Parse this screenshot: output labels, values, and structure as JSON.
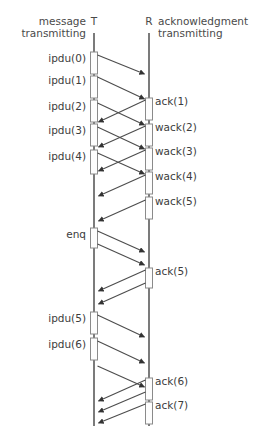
{
  "diagram": {
    "kind": "sequence-diagram",
    "headers": {
      "left_line1": "message",
      "left_line2": "transmitting",
      "right_line1": "acknowledgment",
      "right_line2": "transmitting"
    },
    "actors": [
      {
        "id": "T",
        "label": "T",
        "x": 94
      },
      {
        "id": "R",
        "label": "R",
        "x": 149
      }
    ],
    "lifeline": {
      "top": 33,
      "bottom": 426
    },
    "colors": {
      "line": "#4d4d4d",
      "lifeline": "#5a5a5a",
      "text": "#3c3c3c",
      "header_text": "#4a4a4a",
      "activation_fill": "#fdfdfd",
      "activation_stroke": "#8a8a8a",
      "background": "#ffffff"
    },
    "left_labels": [
      {
        "text": "ipdu(0)",
        "y": 62
      },
      {
        "text": "ipdu(1)",
        "y": 84
      },
      {
        "text": "ipdu(2)",
        "y": 110
      },
      {
        "text": "ipdu(3)",
        "y": 134
      },
      {
        "text": "ipdu(4)",
        "y": 160
      },
      {
        "text": "enq",
        "y": 238
      },
      {
        "text": "ipdu(5)",
        "y": 322
      },
      {
        "text": "ipdu(6)",
        "y": 348
      }
    ],
    "right_labels": [
      {
        "text": "ack(1)",
        "y": 105
      },
      {
        "text": "wack(2)",
        "y": 131
      },
      {
        "text": "wack(3)",
        "y": 155
      },
      {
        "text": "wack(4)",
        "y": 180
      },
      {
        "text": "wack(5)",
        "y": 205
      },
      {
        "text": "ack(5)",
        "y": 275
      },
      {
        "text": "ack(6)",
        "y": 385
      },
      {
        "text": "ack(7)",
        "y": 409
      }
    ],
    "messages": [
      {
        "from": "T",
        "to": "R",
        "label": "ipdu(0)",
        "y1": 55,
        "y2": 74
      },
      {
        "from": "T",
        "to": "R",
        "label": "ipdu(1)",
        "y1": 77,
        "y2": 99
      },
      {
        "from": "T",
        "to": "R",
        "label": "ipdu(2)",
        "y1": 103,
        "y2": 125
      },
      {
        "from": "T",
        "to": "R",
        "label": "ipdu(3)",
        "y1": 127,
        "y2": 149
      },
      {
        "from": "T",
        "to": "R",
        "label": "ipdu(4)",
        "y1": 153,
        "y2": 174
      },
      {
        "from": "R",
        "to": "T",
        "label": "ack(1)",
        "y1": 100,
        "y2": 122
      },
      {
        "from": "R",
        "to": "T",
        "label": "wack(2)",
        "y1": 126,
        "y2": 147
      },
      {
        "from": "R",
        "to": "T",
        "label": "wack(3)",
        "y1": 150,
        "y2": 171
      },
      {
        "from": "R",
        "to": "T",
        "label": "wack(4)",
        "y1": 175,
        "y2": 196
      },
      {
        "from": "R",
        "to": "T",
        "label": "wack(5)",
        "y1": 200,
        "y2": 221
      },
      {
        "from": "T",
        "to": "R",
        "label": "enq",
        "y1": 231,
        "y2": 252
      },
      {
        "from": "T",
        "to": "R",
        "label": "enq",
        "y1": 244,
        "y2": 265
      },
      {
        "from": "R",
        "to": "T",
        "label": "ack(5)",
        "y1": 270,
        "y2": 291
      },
      {
        "from": "R",
        "to": "T",
        "label": "ack(5)",
        "y1": 283,
        "y2": 304
      },
      {
        "from": "T",
        "to": "R",
        "label": "ipdu(5)",
        "y1": 315,
        "y2": 337
      },
      {
        "from": "T",
        "to": "R",
        "label": "ipdu(6)",
        "y1": 341,
        "y2": 363
      },
      {
        "from": "T",
        "to": "R",
        "label": "ipdu(7)",
        "y1": 366,
        "y2": 387
      },
      {
        "from": "R",
        "to": "T",
        "label": "ack(6)",
        "y1": 380,
        "y2": 401
      },
      {
        "from": "R",
        "to": "T",
        "label": "ack(7)",
        "y1": 404,
        "y2": 423
      },
      {
        "from": "R",
        "to": "T",
        "label": "ack(8)",
        "y1": 392,
        "y2": 412
      }
    ],
    "activations": {
      "T": [
        {
          "y": 52,
          "h": 22
        },
        {
          "y": 76,
          "h": 22
        },
        {
          "y": 100,
          "h": 22
        },
        {
          "y": 124,
          "h": 22
        },
        {
          "y": 150,
          "h": 24
        },
        {
          "y": 228,
          "h": 20
        },
        {
          "y": 312,
          "h": 22
        },
        {
          "y": 338,
          "h": 22
        }
      ],
      "R": [
        {
          "y": 98,
          "h": 22
        },
        {
          "y": 124,
          "h": 22
        },
        {
          "y": 148,
          "h": 22
        },
        {
          "y": 172,
          "h": 22
        },
        {
          "y": 197,
          "h": 22
        },
        {
          "y": 268,
          "h": 20
        },
        {
          "y": 378,
          "h": 22
        },
        {
          "y": 402,
          "h": 22
        }
      ]
    }
  }
}
